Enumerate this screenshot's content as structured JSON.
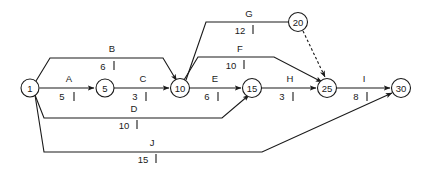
{
  "diagram": {
    "type": "activity-network",
    "line_color": "#1a1a1a",
    "background_color": "#ffffff",
    "nodes": [
      {
        "id": "1",
        "label": "1",
        "cx": 30,
        "cy": 88,
        "r": 9
      },
      {
        "id": "5",
        "label": "5",
        "cx": 105,
        "cy": 88,
        "r": 9
      },
      {
        "id": "10",
        "label": "10",
        "cx": 180,
        "cy": 88,
        "r": 9.5
      },
      {
        "id": "15",
        "label": "15",
        "cx": 252,
        "cy": 88,
        "r": 9.5
      },
      {
        "id": "20",
        "label": "20",
        "cx": 298,
        "cy": 22,
        "r": 9.5
      },
      {
        "id": "25",
        "label": "25",
        "cx": 327,
        "cy": 88,
        "r": 9.5
      },
      {
        "id": "30",
        "label": "30",
        "cx": 401,
        "cy": 88,
        "r": 9.5
      }
    ],
    "edges": [
      {
        "id": "A",
        "activity": "A",
        "duration": "5",
        "from": "1",
        "to": "5",
        "style": "solid",
        "label_x": 69,
        "label_y": 82,
        "dur_x": 62,
        "dur_y": 100,
        "tick_x": 74,
        "tick_y1": 92,
        "tick_y2": 101
      },
      {
        "id": "B",
        "activity": "B",
        "duration": "6",
        "from": "1",
        "to": "10",
        "style": "solid",
        "label_x": 112,
        "label_y": 52,
        "dur_x": 103,
        "dur_y": 70,
        "tick_x": 114,
        "tick_y1": 61,
        "tick_y2": 70
      },
      {
        "id": "C",
        "activity": "C",
        "duration": "3",
        "from": "5",
        "to": "10",
        "style": "solid",
        "label_x": 143,
        "label_y": 82,
        "dur_x": 135,
        "dur_y": 100,
        "tick_x": 146,
        "tick_y1": 92,
        "tick_y2": 101
      },
      {
        "id": "D",
        "activity": "D",
        "duration": "10",
        "from": "1",
        "to": "15",
        "style": "solid",
        "label_x": 134,
        "label_y": 112,
        "dur_x": 124,
        "dur_y": 129,
        "tick_x": 137,
        "tick_y1": 120,
        "tick_y2": 129
      },
      {
        "id": "E",
        "activity": "E",
        "duration": "6",
        "from": "10",
        "to": "15",
        "style": "solid",
        "label_x": 215,
        "label_y": 82,
        "dur_x": 207,
        "dur_y": 100,
        "tick_x": 218,
        "tick_y1": 92,
        "tick_y2": 101
      },
      {
        "id": "F",
        "activity": "F",
        "duration": "10",
        "from": "10",
        "to": "25",
        "style": "solid",
        "label_x": 240,
        "label_y": 52,
        "dur_x": 231,
        "dur_y": 69,
        "tick_x": 244,
        "tick_y1": 60,
        "tick_y2": 69
      },
      {
        "id": "G",
        "activity": "G",
        "duration": "12",
        "from": "10",
        "to": "20",
        "style": "solid",
        "label_x": 249,
        "label_y": 17,
        "dur_x": 240,
        "dur_y": 34,
        "tick_x": 253,
        "tick_y1": 25,
        "tick_y2": 34
      },
      {
        "id": "H",
        "activity": "H",
        "duration": "3",
        "from": "15",
        "to": "25",
        "style": "solid",
        "label_x": 290,
        "label_y": 82,
        "dur_x": 282,
        "dur_y": 100,
        "tick_x": 293,
        "tick_y1": 92,
        "tick_y2": 101
      },
      {
        "id": "I",
        "activity": "I",
        "duration": "8",
        "from": "25",
        "to": "30",
        "style": "solid",
        "label_x": 364,
        "label_y": 82,
        "dur_x": 356,
        "dur_y": 100,
        "tick_x": 367,
        "tick_y1": 92,
        "tick_y2": 101
      },
      {
        "id": "J",
        "activity": "J",
        "duration": "15",
        "from": "1",
        "to": "30",
        "style": "solid",
        "label_x": 152,
        "label_y": 146,
        "dur_x": 143,
        "dur_y": 163,
        "tick_x": 156,
        "tick_y1": 154,
        "tick_y2": 163
      },
      {
        "id": "dummy-20-25",
        "activity": "",
        "duration": "",
        "from": "20",
        "to": "25",
        "style": "dashed",
        "label_x": 0,
        "label_y": 0,
        "dur_x": 0,
        "dur_y": 0,
        "tick_x": 0,
        "tick_y1": 0,
        "tick_y2": 0
      }
    ]
  }
}
